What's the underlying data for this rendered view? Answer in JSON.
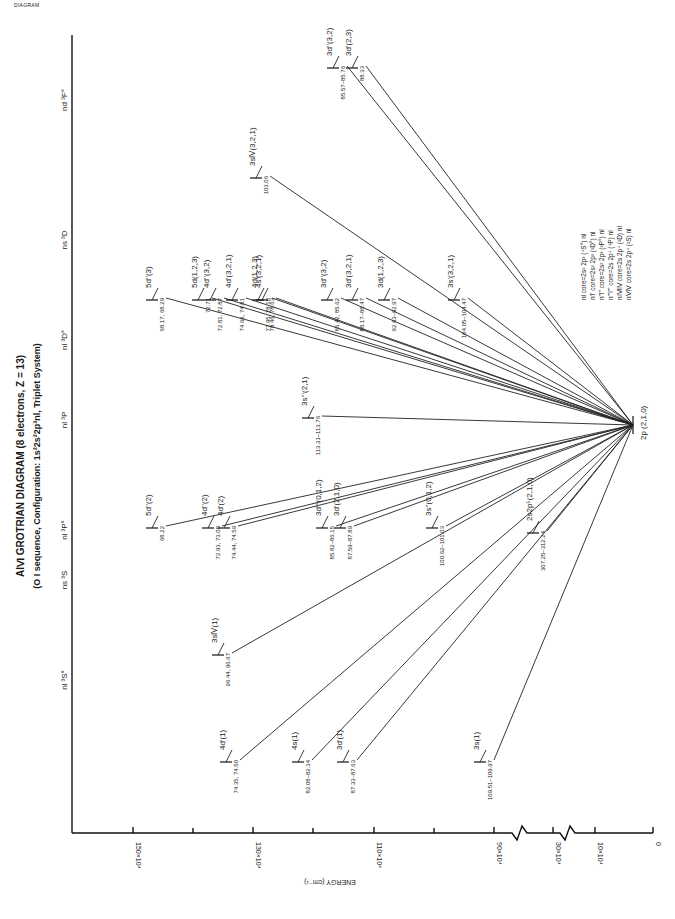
{
  "corner_tag": "DIAGRAM",
  "title": "AlⅥ GROTRIAN DIAGRAM (8 electrons, Z = 13)",
  "subtitle": "(O I sequence, Configuration: 1s²2s²2p³nl, Triplet System)",
  "axis": {
    "label": "ENERGY (cm⁻¹)",
    "ticks": [
      "150×10⁴",
      "130×10⁴",
      "110×10⁴",
      "90×10⁴",
      "30×10⁴",
      "10×10⁴",
      "0"
    ]
  },
  "columns": [
    "nl ³S°",
    "ns ³S",
    "nl ³P°",
    "nl ³P",
    "nl ³D°",
    "ns ³D",
    "nd ³F°"
  ],
  "legend": [
    "nl  core=2s² 2p³ (⁴S°) nl",
    "n'l'  core=2s² 2p³ (²D°) nl",
    "n''l''  core=2s² 2p³ (²P°) nl",
    "n'''l'''  core=2s 2p⁴ (⁴P) nl",
    "nⅣlⅣ  core=2s 2p⁴ (²D) nl",
    "nⅤlⅤ  core=2s 2p⁴ (²S) nl"
  ],
  "ground": "2p (2,1,0)",
  "levels": [
    {
      "label": "4d'(1)",
      "wl": "74.35, 74.50"
    },
    {
      "label": "4s(1)",
      "wl": "82.08–82.34"
    },
    {
      "label": "3d'(1)",
      "wl": "87.33–87.63"
    },
    {
      "label": "3s(1)",
      "wl": "109.51–109.97"
    },
    {
      "label": "3sⅣ(1)",
      "wl": "96.44, 96.67"
    },
    {
      "label": "5d''(2)",
      "wl": "68.22"
    },
    {
      "label": "4d''(2)",
      "wl": "72.93, 73.08"
    },
    {
      "label": "4d'(2)",
      "wl": "74.44, 74.59"
    },
    {
      "label": "3d'''(0,1,2)",
      "wl": "85.82–86.15"
    },
    {
      "label": "3d'(2,1,0)",
      "wl": "87.59–87.89"
    },
    {
      "label": "3s''(0,1,2)",
      "wl": "100.62–101.03"
    },
    {
      "label": "2s2p⁵(2,1,0)",
      "wl": "307.25–312.24"
    },
    {
      "label": "3s'''(2,1)",
      "wl": "113.31–113.76"
    },
    {
      "label": "5d''(3)",
      "wl": "68.17, 68.29"
    },
    {
      "label": "5d(1,2,3)",
      "wl": "72.71"
    },
    {
      "label": "4d''(3,2)",
      "wl": "72.81, 72.87"
    },
    {
      "label": "4d'(3,2,1)",
      "wl": "74.66, 74.81"
    },
    {
      "label": "4d(1,2,3)",
      "wl": "77.95, 78.18"
    },
    {
      "label": "4s'(3,2,1)",
      "wl": "78.46, 78.63"
    },
    {
      "label": "3d''(3,2)",
      "wl": "85.42, 85.62"
    },
    {
      "label": "3d'(3,2,1)",
      "wl": "88.17–88.47"
    },
    {
      "label": "3d(1,2,3)",
      "wl": "92.63–92.97"
    },
    {
      "label": "3s'(3,2,1)",
      "wl": "104.05–104.47"
    },
    {
      "label": "3sⅣ(3,2,1)",
      "wl": "103.06"
    },
    {
      "label": "3d''(3,2)",
      "wl": "85.57–85.76"
    },
    {
      "label": "3d'(2,3)",
      "wl": "88.33"
    }
  ]
}
